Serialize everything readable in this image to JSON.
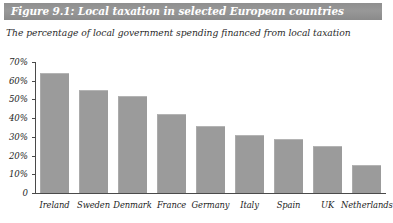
{
  "figure": {
    "title": "Figure 9.1: Local taxation in selected European countries",
    "subtitle": "The percentage of local government spending financed from local taxation",
    "banner_color": "#919191",
    "banner_text_color": "#ffffff",
    "bar_color": "#9b9b9b",
    "axis_color": "#4a4a4a",
    "background_color": "#ffffff"
  },
  "chart_data": {
    "type": "bar",
    "title": "Figure 9.1: Local taxation in selected European countries",
    "subtitle": "The percentage of local government spending financed from local taxation",
    "xlabel": "",
    "ylabel": "",
    "categories": [
      "Ireland",
      "Sweden",
      "Denmark",
      "France",
      "Germany",
      "Italy",
      "Spain",
      "UK",
      "Netherlands"
    ],
    "values": [
      64,
      55,
      52,
      42,
      36,
      31,
      29,
      25,
      15
    ],
    "ylim": [
      0,
      70
    ],
    "ytick_values": [
      0,
      10,
      20,
      30,
      40,
      50,
      60,
      70
    ],
    "ytick_labels": [
      "0",
      "10%",
      "20%",
      "30%",
      "40%",
      "50%",
      "60%",
      "70%"
    ],
    "grid": false,
    "legend": false,
    "legend_position": "none",
    "series": [
      {
        "name": "Percentage of local government spending financed from local taxation",
        "values": [
          64,
          55,
          52,
          42,
          36,
          31,
          29,
          25,
          15
        ]
      }
    ]
  }
}
